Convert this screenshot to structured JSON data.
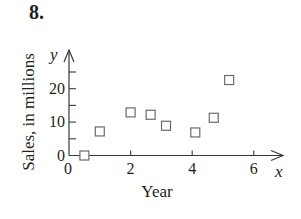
{
  "figure": {
    "problem_number": "8."
  },
  "chart_data": {
    "type": "scatter",
    "title": "",
    "xlabel": "Year",
    "ylabel": "Sales, in millions",
    "x_axis_variable": "x",
    "y_axis_variable": "y",
    "xlim": [
      0,
      7
    ],
    "ylim": [
      0,
      25
    ],
    "x_ticks": [
      0,
      2,
      4,
      6
    ],
    "x_tick_labels": [
      "0",
      "2",
      "4",
      "6"
    ],
    "y_ticks": [
      0,
      5,
      10,
      15,
      20,
      25
    ],
    "y_tick_labels": [
      "0",
      "",
      "10",
      "",
      "20",
      ""
    ],
    "grid": false,
    "legend": null,
    "marker": "open-square",
    "series": [
      {
        "name": "Sales",
        "points": [
          {
            "x": 0.5,
            "y": 0
          },
          {
            "x": 1.0,
            "y": 7.2
          },
          {
            "x": 2.0,
            "y": 12.9
          },
          {
            "x": 2.65,
            "y": 12.2
          },
          {
            "x": 3.15,
            "y": 8.9
          },
          {
            "x": 4.1,
            "y": 6.9
          },
          {
            "x": 4.7,
            "y": 11.3
          },
          {
            "x": 5.2,
            "y": 22.6
          }
        ]
      }
    ]
  }
}
